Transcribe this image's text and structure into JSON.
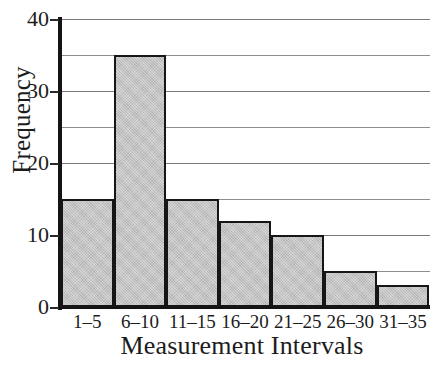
{
  "chart_data": {
    "type": "bar",
    "title": "",
    "xlabel": "Measurement Intervals",
    "ylabel": "Frequency",
    "categories": [
      "1–5",
      "6–10",
      "11–15",
      "16–20",
      "21–25",
      "26–30",
      "31–35"
    ],
    "values": [
      15,
      35,
      15,
      12,
      10,
      5,
      3
    ],
    "ylim": [
      0,
      40
    ],
    "ytick_labels": [
      "0",
      "10",
      "20",
      "30",
      "40"
    ],
    "ytick_values": [
      0,
      10,
      20,
      30,
      40
    ],
    "gridlines": [
      5,
      10,
      15,
      20,
      25,
      30,
      35,
      40
    ],
    "grid": true,
    "legend": "none",
    "bar_fill_color": "#c3c3c3",
    "bar_border_color": "#161616",
    "gridline_color": "#8e8e8e",
    "axis_color": "#141414",
    "background_color": "#ffffff"
  }
}
